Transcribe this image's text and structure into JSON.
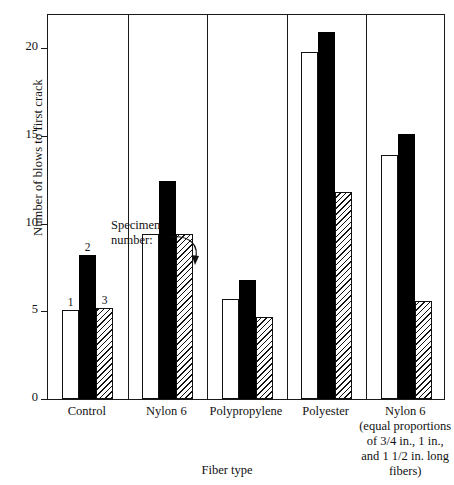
{
  "chart_data": {
    "type": "bar",
    "title": "",
    "xlabel": "Fiber type",
    "ylabel": "Number of blows to first crack",
    "ylim": [
      0,
      22
    ],
    "yticks": [
      0,
      5,
      10,
      15,
      20
    ],
    "ytick_labels": [
      "0",
      "5",
      "10",
      "15",
      "20"
    ],
    "grid": false,
    "legend": "none",
    "categories": [
      "Control",
      "Nylon 6",
      "Polypropylene",
      "Polyester",
      "Nylon 6 (equal proportions of 3/4 in., 1 in., and 1 1/2 in. long fibers)"
    ],
    "series": [
      {
        "name": "Specimen 1",
        "fill": "open",
        "values": [
          5.1,
          9.4,
          5.7,
          19.8,
          13.9
        ]
      },
      {
        "name": "Specimen 2",
        "fill": "solid",
        "values": [
          8.2,
          12.4,
          6.8,
          20.9,
          15.1
        ]
      },
      {
        "name": "Specimen 3",
        "fill": "hatch",
        "values": [
          5.2,
          9.4,
          4.7,
          11.8,
          5.6
        ]
      }
    ],
    "annotation": {
      "text_line1": "Specimen",
      "text_line2": "number:",
      "points_to": "2"
    },
    "bar_labels": {
      "control": [
        "1",
        "2",
        "3"
      ]
    }
  },
  "axis": {
    "y_title": "Number of blows to first crack",
    "x_title": "Fiber type"
  },
  "xlabels": [
    {
      "main": "Control",
      "sub": []
    },
    {
      "main": "Nylon 6",
      "sub": []
    },
    {
      "main": "Polypropylene",
      "sub": []
    },
    {
      "main": "Polyester",
      "sub": []
    },
    {
      "main": "Nylon 6",
      "sub": [
        "(equal proportions",
        "of 3/4 in., 1 in.,",
        "and 1 1/2 in. long",
        "fibers)"
      ]
    }
  ],
  "colors": {
    "axis": "#1a1a1a",
    "solid_bar": "#000000",
    "open_bar": "#ffffff",
    "background": "#ffffff"
  }
}
